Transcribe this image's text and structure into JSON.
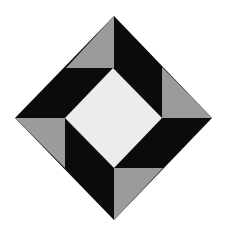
{
  "figure": {
    "colors": {
      "background": "#ffffff",
      "black": "#0b0b0b",
      "gray": "#9b9b9b",
      "center": "#ececec"
    },
    "outer_diamond": [
      [
        114,
        16
      ],
      [
        212,
        118
      ],
      [
        114,
        220
      ],
      [
        15,
        118
      ]
    ],
    "inner_diamond": [
      [
        113,
        68
      ],
      [
        162,
        118
      ],
      [
        114,
        168
      ],
      [
        65,
        118
      ]
    ],
    "gray_triangles": [
      {
        "name": "top",
        "points": [
          [
            114,
            16
          ],
          [
            114,
            68
          ],
          [
            66,
            68
          ]
        ]
      },
      {
        "name": "right",
        "points": [
          [
            162,
            67
          ],
          [
            162,
            118
          ],
          [
            212,
            118
          ]
        ]
      },
      {
        "name": "bottom",
        "points": [
          [
            114,
            168
          ],
          [
            163,
            168
          ],
          [
            114,
            220
          ]
        ]
      },
      {
        "name": "left",
        "points": [
          [
            15,
            118
          ],
          [
            65,
            118
          ],
          [
            65,
            168
          ]
        ]
      }
    ]
  }
}
